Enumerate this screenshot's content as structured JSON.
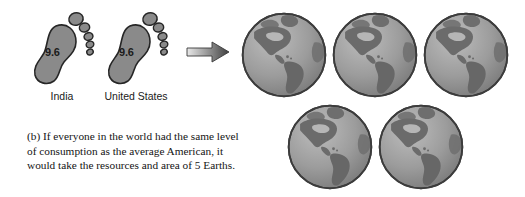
{
  "figure": {
    "caption_lines": [
      "(b) If everyone in the world had the same level",
      "of consumption as the average American, it",
      "would take the resources and area of 5 Earths."
    ],
    "caption_full": "(b) If everyone in the world had the same level of consumption as the average American, it would take the resources and area of 5 Earths.",
    "label": "(b)",
    "earth_count": 5
  },
  "footprints": [
    {
      "label": "India",
      "value": "9.6",
      "icon": "footprint-icon"
    },
    {
      "label": "United States",
      "value": "9.6",
      "icon": "footprint-icon"
    }
  ],
  "arrow": {
    "icon": "arrow-right-icon",
    "direction": "right"
  },
  "globes": [
    {
      "icon": "globe-americas-icon",
      "row": "top",
      "position": 1
    },
    {
      "icon": "globe-americas-icon",
      "row": "top",
      "position": 2
    },
    {
      "icon": "globe-americas-icon",
      "row": "top",
      "position": 3
    },
    {
      "icon": "globe-americas-icon",
      "row": "bottom",
      "position": 4
    },
    {
      "icon": "globe-americas-icon",
      "row": "bottom",
      "position": 5
    }
  ],
  "colors": {
    "background": "#ffffff",
    "footprint_fill": "#8a8a8a",
    "footprint_stroke": "#2b2b2b",
    "globe_ocean": "#9a9a9a",
    "globe_land": "#6f6f6f",
    "globe_outline": "#3a3a3a",
    "arrow_light": "#dedede",
    "arrow_dark": "#4a4a4a",
    "text": "#141414"
  }
}
